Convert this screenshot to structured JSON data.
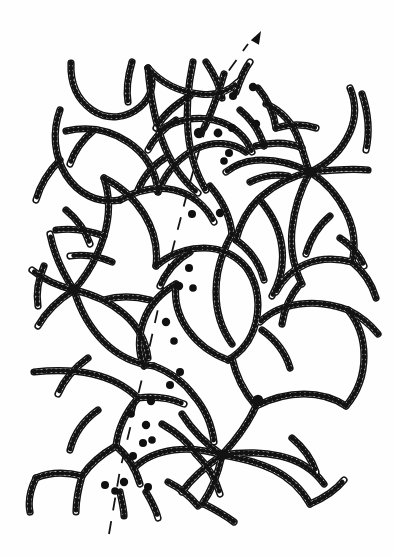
{
  "figure": {
    "caption": "",
    "width": 393,
    "height": 558,
    "background_color": "#fefefe",
    "ink_color": "#121212",
    "bead_fill_color": "#fdfdfd",
    "style": "line drawing, bead-and-chain schematic"
  },
  "legend_items": [
    {
      "name": "bead-chain",
      "label": "Polymer chain drawn as a string of open circles (beads)"
    },
    {
      "name": "junction-node",
      "label": "Crosslink junction where several chains converge"
    },
    {
      "name": "ruptured-chain-end",
      "label": "Broken chain end marked by a solid black bead"
    },
    {
      "name": "rupture-path",
      "label": "Dashed line tracing the crack / rupture plane"
    },
    {
      "name": "propagation-arrow",
      "label": "Arrow showing direction of crack propagation"
    }
  ],
  "rupture_path": {
    "name": "rupture-path",
    "stroke_color": "#141414",
    "stroke_width": 1.8,
    "dash_pattern": "13 11",
    "direction": "bottom-left to top-right",
    "points": "109,534 120,470 133,416 147,358 160,300 174,244 189,186 205,130 222,80 248,44",
    "arrow": {
      "name": "propagation-arrow",
      "tip_x": 261,
      "tip_y": 31,
      "angle_deg": -62,
      "label": ""
    }
  },
  "ruptured_chain_ends": [
    {
      "x": 253,
      "y": 87,
      "r": 4.2
    },
    {
      "x": 233,
      "y": 96,
      "r": 4.0
    },
    {
      "x": 256,
      "y": 124,
      "r": 4.2
    },
    {
      "x": 232,
      "y": 128,
      "r": 4.0
    },
    {
      "x": 218,
      "y": 133,
      "r": 4.4
    },
    {
      "x": 229,
      "y": 153,
      "r": 4.0
    },
    {
      "x": 224,
      "y": 161,
      "r": 3.8
    },
    {
      "x": 192,
      "y": 214,
      "r": 4.0
    },
    {
      "x": 220,
      "y": 213,
      "r": 4.2
    },
    {
      "x": 189,
      "y": 268,
      "r": 4.0
    },
    {
      "x": 179,
      "y": 286,
      "r": 4.2
    },
    {
      "x": 193,
      "y": 288,
      "r": 3.8
    },
    {
      "x": 166,
      "y": 322,
      "r": 4.2
    },
    {
      "x": 174,
      "y": 341,
      "r": 3.8
    },
    {
      "x": 180,
      "y": 372,
      "r": 4.0
    },
    {
      "x": 170,
      "y": 385,
      "r": 4.0
    },
    {
      "x": 151,
      "y": 401,
      "r": 4.2
    },
    {
      "x": 131,
      "y": 414,
      "r": 3.8
    },
    {
      "x": 146,
      "y": 425,
      "r": 4.2
    },
    {
      "x": 143,
      "y": 443,
      "r": 4.0
    },
    {
      "x": 133,
      "y": 456,
      "r": 4.0
    },
    {
      "x": 124,
      "y": 482,
      "r": 4.2
    },
    {
      "x": 105,
      "y": 485,
      "r": 4.0
    },
    {
      "x": 115,
      "y": 491,
      "r": 3.8
    },
    {
      "x": 148,
      "y": 487,
      "r": 4.0
    },
    {
      "x": 152,
      "y": 440,
      "r": 3.8
    }
  ],
  "junction_nodes": [
    {
      "x": 310,
      "y": 172,
      "arms": 7,
      "label": "crosslink-junction-right-upper"
    },
    {
      "x": 74,
      "y": 290,
      "arms": 6,
      "label": "crosslink-junction-left"
    },
    {
      "x": 222,
      "y": 455,
      "arms": 7,
      "label": "crosslink-junction-bottom-center"
    },
    {
      "x": 199,
      "y": 133,
      "arms": 5,
      "label": "crosslink-junction-top-center"
    },
    {
      "x": 258,
      "y": 400,
      "arms": 4,
      "label": "crosslink-junction-right-lower"
    }
  ],
  "chains": [
    {
      "name": "chain-01",
      "d": "M 71,63 C 70,86 78,100 92,110 C 108,121 127,118 140,107 C 153,96 155,80 148,68"
    },
    {
      "name": "chain-02",
      "d": "M 148,68 C 162,84 180,92 200,94 C 214,96 228,92 238,82"
    },
    {
      "name": "chain-03",
      "d": "M 60,110 C 52,132 54,156 66,175 C 78,194 98,204 120,200"
    },
    {
      "name": "chain-04",
      "d": "M 66,131 C 88,126 110,130 128,142 C 146,154 156,172 158,192"
    },
    {
      "name": "chain-05",
      "d": "M 148,68 C 150,92 154,118 162,140 C 170,162 182,180 198,193"
    },
    {
      "name": "chain-06",
      "d": "M 120,200 C 138,190 156,186 174,190 C 192,194 206,206 214,222"
    },
    {
      "name": "chain-07",
      "d": "M 158,192 C 166,172 180,156 198,148 C 214,141 232,142 246,152"
    },
    {
      "name": "chain-08",
      "d": "M 193,62 C 188,86 186,110 188,132 C 190,154 196,174 206,190"
    },
    {
      "name": "chain-09",
      "d": "M 160,130 C 176,120 196,116 214,120 C 232,124 246,136 252,152"
    },
    {
      "name": "chain-10",
      "d": "M 224,74 C 218,94 212,112 204,128"
    },
    {
      "name": "chain-11",
      "d": "M 236,92 C 240,80 244,70 250,62"
    },
    {
      "name": "chain-12",
      "d": "M 266,104 C 280,110 292,122 298,138 C 304,152 306,166 310,172"
    },
    {
      "name": "chain-13",
      "d": "M 310,172 C 328,164 342,150 350,132 C 356,118 356,102 350,88"
    },
    {
      "name": "chain-14",
      "d": "M 310,172 C 330,170 350,168 368,170"
    },
    {
      "name": "chain-15",
      "d": "M 310,172 C 326,182 338,196 346,212 C 354,228 356,246 352,262"
    },
    {
      "name": "chain-16",
      "d": "M 310,172 C 300,190 294,210 292,230 C 290,250 294,268 302,284"
    },
    {
      "name": "chain-17",
      "d": "M 310,172 C 292,176 276,184 262,196 C 248,208 240,224 236,240"
    },
    {
      "name": "chain-18",
      "d": "M 310,172 C 294,164 278,160 262,160 C 248,160 236,164 226,172"
    },
    {
      "name": "chain-19",
      "d": "M 362,94 C 368,112 370,132 366,150"
    },
    {
      "name": "chain-20",
      "d": "M 256,146 C 272,142 288,142 302,148"
    },
    {
      "name": "chain-21",
      "d": "M 74,290 C 58,286 44,280 32,270"
    },
    {
      "name": "chain-22",
      "d": "M 74,290 C 58,300 46,312 38,326"
    },
    {
      "name": "chain-23",
      "d": "M 74,290 C 62,272 54,254 50,234"
    },
    {
      "name": "chain-24",
      "d": "M 74,290 C 88,274 98,256 104,236 C 110,216 110,196 104,178"
    },
    {
      "name": "chain-25",
      "d": "M 74,290 C 92,294 110,302 124,314 C 138,326 146,342 148,358"
    },
    {
      "name": "chain-26",
      "d": "M 74,290 C 80,310 90,328 104,342 C 118,356 136,364 154,366"
    },
    {
      "name": "chain-27",
      "d": "M 104,178 C 120,186 134,198 144,214 C 154,230 158,248 156,266"
    },
    {
      "name": "chain-28",
      "d": "M 156,266 C 170,254 186,248 204,248 C 222,248 238,256 248,270"
    },
    {
      "name": "chain-29",
      "d": "M 248,270 C 258,286 260,304 256,322 C 252,338 242,352 228,360"
    },
    {
      "name": "chain-30",
      "d": "M 228,360 C 212,354 198,344 188,330 C 178,316 174,300 176,284"
    },
    {
      "name": "chain-31",
      "d": "M 176,284 C 162,292 150,304 144,320 C 138,336 138,352 144,366"
    },
    {
      "name": "chain-32",
      "d": "M 222,455 C 236,440 248,424 256,406"
    },
    {
      "name": "chain-33",
      "d": "M 222,455 C 206,444 192,430 182,414"
    },
    {
      "name": "chain-34",
      "d": "M 222,455 C 240,458 258,462 274,470 C 290,478 302,490 310,504"
    },
    {
      "name": "chain-35",
      "d": "M 222,455 C 218,474 212,490 202,504"
    },
    {
      "name": "chain-36",
      "d": "M 222,455 C 206,466 192,478 182,492"
    },
    {
      "name": "chain-37",
      "d": "M 222,455 C 242,452 262,452 280,456 C 298,460 314,470 324,484"
    },
    {
      "name": "chain-38",
      "d": "M 222,455 C 206,450 190,448 174,450 C 158,452 144,458 134,468"
    },
    {
      "name": "chain-39",
      "d": "M 256,406 C 272,398 288,394 304,394 C 320,394 334,398 346,406"
    },
    {
      "name": "chain-40",
      "d": "M 256,406 C 244,392 236,376 232,358"
    },
    {
      "name": "chain-41",
      "d": "M 346,406 C 358,392 364,374 364,356 C 364,338 358,322 348,310"
    },
    {
      "name": "chain-42",
      "d": "M 348,310 C 332,304 316,302 300,304 C 284,306 270,312 260,322"
    },
    {
      "name": "chain-43",
      "d": "M 348,310 C 360,316 370,324 378,334"
    },
    {
      "name": "chain-44",
      "d": "M 352,262 C 336,258 320,258 306,264 C 292,270 282,280 276,292"
    },
    {
      "name": "chain-45",
      "d": "M 352,262 C 364,272 372,284 376,298"
    },
    {
      "name": "chain-46",
      "d": "M 260,200 C 272,214 280,230 282,248 C 284,266 280,282 272,296"
    },
    {
      "name": "chain-47",
      "d": "M 236,240 C 250,250 260,264 264,280"
    },
    {
      "name": "chain-48",
      "d": "M 210,186 C 222,200 230,216 232,234"
    },
    {
      "name": "chain-49",
      "d": "M 232,234 C 222,252 216,272 216,292 C 216,312 222,330 232,344"
    },
    {
      "name": "chain-50",
      "d": "M 190,96 C 176,104 164,114 156,128"
    },
    {
      "name": "chain-51",
      "d": "M 104,236 C 88,230 72,228 56,230"
    },
    {
      "name": "chain-52",
      "d": "M 112,262 C 98,256 84,254 70,256"
    },
    {
      "name": "chain-53",
      "d": "M 150,300 C 134,296 118,296 104,300"
    },
    {
      "name": "chain-54",
      "d": "M 34,372 C 54,370 74,370 92,374 C 110,378 126,386 138,398"
    },
    {
      "name": "chain-55",
      "d": "M 138,398 C 126,412 118,428 116,446"
    },
    {
      "name": "chain-56",
      "d": "M 116,446 C 102,454 90,464 82,476"
    },
    {
      "name": "chain-57",
      "d": "M 82,476 C 66,472 50,472 36,478"
    },
    {
      "name": "chain-58",
      "d": "M 82,476 C 78,490 76,502 76,512"
    },
    {
      "name": "chain-59",
      "d": "M 36,478 C 30,490 28,502 30,512"
    },
    {
      "name": "chain-60",
      "d": "M 116,446 C 128,456 136,470 140,484"
    },
    {
      "name": "chain-61",
      "d": "M 138,398 C 154,396 170,398 184,404"
    },
    {
      "name": "chain-62",
      "d": "M 98,410 C 84,420 74,434 70,450"
    },
    {
      "name": "chain-63",
      "d": "M 154,366 C 170,372 184,382 194,396"
    },
    {
      "name": "chain-64",
      "d": "M 194,396 C 206,410 212,426 214,442"
    },
    {
      "name": "chain-65",
      "d": "M 162,424 C 176,432 188,442 196,454"
    },
    {
      "name": "chain-66",
      "d": "M 168,482 C 180,488 190,496 198,506"
    },
    {
      "name": "chain-67",
      "d": "M 146,492 C 152,502 156,510 158,518"
    },
    {
      "name": "chain-68",
      "d": "M 120,492 C 122,502 124,510 124,516"
    },
    {
      "name": "chain-69",
      "d": "M 258,88 C 268,100 274,114 276,128"
    },
    {
      "name": "chain-70",
      "d": "M 276,128 C 290,124 304,124 316,128"
    },
    {
      "name": "chain-71",
      "d": "M 240,110 C 252,120 260,132 264,146"
    },
    {
      "name": "chain-72",
      "d": "M 88,358 C 74,368 64,380 58,394"
    },
    {
      "name": "chain-73",
      "d": "M 206,62 C 214,74 220,86 222,98"
    },
    {
      "name": "chain-74",
      "d": "M 132,62 C 128,76 126,90 128,102"
    },
    {
      "name": "chain-75",
      "d": "M 44,266 C 38,280 36,294 38,306"
    },
    {
      "name": "chain-76",
      "d": "M 300,284 C 290,296 284,310 282,324"
    },
    {
      "name": "chain-77",
      "d": "M 190,252 C 176,260 166,272 160,286"
    },
    {
      "name": "chain-78",
      "d": "M 250,182 C 262,176 276,174 288,176"
    },
    {
      "name": "chain-79",
      "d": "M 330,216 C 318,226 310,240 306,254"
    },
    {
      "name": "chain-80",
      "d": "M 204,504 C 216,510 226,516 234,522"
    },
    {
      "name": "chain-81",
      "d": "M 60,160 C 48,172 40,186 36,200"
    },
    {
      "name": "chain-82",
      "d": "M 94,130 C 82,140 74,152 70,164"
    },
    {
      "name": "chain-83",
      "d": "M 168,156 C 154,164 144,176 138,190"
    },
    {
      "name": "chain-84",
      "d": "M 262,330 C 276,340 286,354 290,368"
    },
    {
      "name": "chain-85",
      "d": "M 196,454 C 208,466 216,480 220,494"
    },
    {
      "name": "chain-86",
      "d": "M 310,504 C 324,498 336,490 344,480"
    },
    {
      "name": "chain-87",
      "d": "M 176,120 C 164,128 154,138 148,150"
    },
    {
      "name": "chain-88",
      "d": "M 292,438 C 304,448 312,460 316,472"
    },
    {
      "name": "chain-89",
      "d": "M 66,210 C 78,220 86,232 90,244"
    },
    {
      "name": "chain-90",
      "d": "M 340,238 C 352,246 360,256 364,266"
    }
  ]
}
